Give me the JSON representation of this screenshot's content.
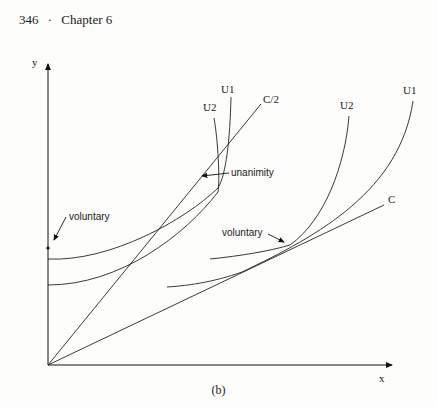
{
  "page": {
    "number": "346",
    "separator": "·",
    "chapter": "Chapter 6"
  },
  "figure": {
    "caption": "(b)",
    "axes": {
      "x_label": "x",
      "y_label": "y"
    },
    "lines": [
      {
        "name": "C/2",
        "label": "C/2"
      },
      {
        "name": "C",
        "label": "C"
      }
    ],
    "curves": {
      "left_u1": "U1",
      "left_u2": "U2",
      "right_u1": "U1",
      "right_u2": "U2"
    },
    "annotations": {
      "unanimity": "unanimity",
      "voluntary_left": "voluntary",
      "voluntary_right": "voluntary"
    }
  }
}
